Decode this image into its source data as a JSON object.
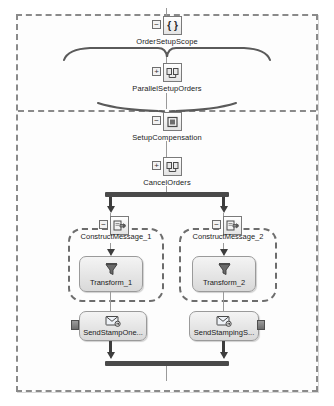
{
  "diagram": {
    "type": "orchestration-workflow",
    "nodes": [
      {
        "id": "order_setup_scope",
        "label": "OrderSetupScope",
        "icon": "scope-braces-icon",
        "toggle": "minus"
      },
      {
        "id": "parallel_setup",
        "label": "ParallelSetupOrders",
        "icon": "parallel-actions-icon",
        "toggle": "plus"
      },
      {
        "id": "setup_compensation",
        "label": "SetupCompensation",
        "icon": "compensation-icon",
        "toggle": "minus"
      },
      {
        "id": "cancel_orders",
        "label": "CancelOrders",
        "icon": "parallel-actions-icon",
        "toggle": "plus"
      }
    ],
    "branches": [
      {
        "id": "branch_left",
        "group_label": "ConstructMessage_1",
        "group_icon": "construct-message-icon",
        "group_toggle": "minus",
        "inner_label": "Transform_1",
        "inner_icon": "transform-funnel-icon",
        "send_label": "SendStampOne...",
        "send_icon": "send-envelope-icon",
        "port_side": "left"
      },
      {
        "id": "branch_right",
        "group_label": "ConstructMessage_2",
        "group_icon": "construct-message-icon",
        "group_toggle": "minus",
        "inner_label": "Transform_2",
        "inner_icon": "transform-funnel-icon",
        "send_label": "SendStampingS...",
        "send_icon": "send-envelope-icon",
        "port_side": "right"
      }
    ],
    "toggle_glyphs": {
      "minus": "−",
      "plus": "+"
    },
    "colors": {
      "frame_border": "#8a8a8a",
      "connector": "#9a9a9a",
      "bar": "#4a4a4a",
      "node_fill": "#e4e4e4",
      "text": "#1b1b1b",
      "canvas": "#ffffff"
    }
  }
}
